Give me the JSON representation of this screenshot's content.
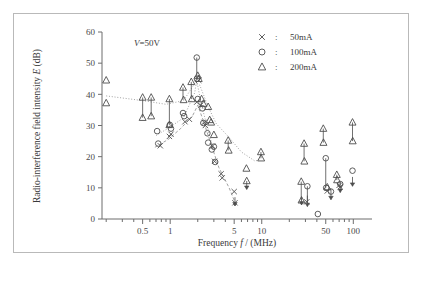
{
  "figure": {
    "annotation": "V=50V",
    "annotation_symbol": "V",
    "annotation_rest": "=50V"
  },
  "legend": {
    "position": "top-right",
    "separator": ":",
    "entries": [
      {
        "marker": "x-marker-icon",
        "symbol": "×",
        "label": "50mA"
      },
      {
        "marker": "circle-marker-icon",
        "symbol": "○",
        "label": "100mA"
      },
      {
        "marker": "triangle-marker-icon",
        "symbol": "△",
        "label": "200mA"
      }
    ]
  },
  "chart_data": {
    "type": "scatter",
    "title": "",
    "xlabel": "Frequency f / (MHz)",
    "xlabel_parts": {
      "pre": "Frequency ",
      "italic": "f",
      "post": " / (MHz)"
    },
    "ylabel": "Radio-interference field intensity E (dB)",
    "ylabel_parts": {
      "pre": "Radio-interference field intensity ",
      "italic": "E",
      "post": " (dB)"
    },
    "xscale": "log",
    "xlim": [
      0.18,
      160
    ],
    "ylim": [
      0,
      60
    ],
    "grid": false,
    "xticks": [
      0.5,
      1,
      5,
      10,
      50,
      100
    ],
    "xticklabels": [
      "0.5",
      "1",
      "5",
      "10",
      "50",
      "100"
    ],
    "xminorticks": [
      0.2,
      0.3,
      0.4,
      0.6,
      0.7,
      0.8,
      0.9,
      2,
      3,
      4,
      6,
      7,
      8,
      9,
      20,
      30,
      40,
      60,
      70,
      80,
      90
    ],
    "yticks": [
      0,
      10,
      20,
      30,
      40,
      50,
      60
    ],
    "yticklabels": [
      "0",
      "10",
      "20",
      "30",
      "40",
      "50",
      "60"
    ],
    "condition": "V=50V",
    "series": [
      {
        "name": "50mA",
        "marker": "x",
        "points": [
          {
            "x": 0.78,
            "y": 23.5
          },
          {
            "x": 0.98,
            "y": 26.5
          },
          {
            "x": 1.02,
            "y": 27.2
          },
          {
            "x": 1.45,
            "y": 31.2
          },
          {
            "x": 1.62,
            "y": 32.0
          },
          {
            "x": 1.95,
            "y": 37.5
          },
          {
            "x": 2.05,
            "y": 44.5
          },
          {
            "x": 2.15,
            "y": 36.5
          },
          {
            "x": 2.35,
            "y": 31.0
          },
          {
            "x": 2.42,
            "y": 30.0
          },
          {
            "x": 2.9,
            "y": 23.4
          },
          {
            "x": 3.05,
            "y": 18.5
          },
          {
            "x": 3.6,
            "y": 14.5
          },
          {
            "x": 3.7,
            "y": 13.2
          },
          {
            "x": 5.0,
            "y": 8.8
          },
          {
            "x": 5.1,
            "y": 5.2
          },
          {
            "x": 31.0,
            "y": 5.5
          },
          {
            "x": 52.0,
            "y": 9.0
          },
          {
            "x": 70.0,
            "y": 10.8
          },
          {
            "x": 72.0,
            "y": 10.3
          }
        ]
      },
      {
        "name": "100mA",
        "marker": "circle",
        "points": [
          {
            "x": 0.72,
            "y": 28.2
          },
          {
            "x": 0.74,
            "y": 24.2
          },
          {
            "x": 0.99,
            "y": 30.2
          },
          {
            "x": 1.02,
            "y": 29.0
          },
          {
            "x": 1.38,
            "y": 34.0
          },
          {
            "x": 1.42,
            "y": 33.0
          },
          {
            "x": 1.95,
            "y": 51.8
          },
          {
            "x": 1.96,
            "y": 45.0
          },
          {
            "x": 2.0,
            "y": 38.5
          },
          {
            "x": 2.25,
            "y": 35.5
          },
          {
            "x": 2.3,
            "y": 30.8
          },
          {
            "x": 2.55,
            "y": 27.5
          },
          {
            "x": 2.6,
            "y": 24.5
          },
          {
            "x": 2.85,
            "y": 22.3
          },
          {
            "x": 3.0,
            "y": 23.2
          },
          {
            "x": 3.1,
            "y": 18.3
          },
          {
            "x": 31.5,
            "y": 10.5
          },
          {
            "x": 41.0,
            "y": 1.6
          },
          {
            "x": 50.0,
            "y": 19.5
          },
          {
            "x": 50.5,
            "y": 10.0
          },
          {
            "x": 57.0,
            "y": 8.8
          },
          {
            "x": 72.0,
            "y": 11.2
          },
          {
            "x": 98.0,
            "y": 15.5
          }
        ]
      },
      {
        "name": "200mA",
        "marker": "triangle",
        "points": [
          {
            "x": 0.2,
            "y": 44.5
          },
          {
            "x": 0.2,
            "y": 37.2
          },
          {
            "x": 0.5,
            "y": 39.0
          },
          {
            "x": 0.5,
            "y": 32.5
          },
          {
            "x": 0.62,
            "y": 39.0
          },
          {
            "x": 0.62,
            "y": 33.0
          },
          {
            "x": 0.98,
            "y": 38.5
          },
          {
            "x": 0.98,
            "y": 30.2
          },
          {
            "x": 1.38,
            "y": 42.2
          },
          {
            "x": 1.4,
            "y": 38.2
          },
          {
            "x": 1.7,
            "y": 44.0
          },
          {
            "x": 1.72,
            "y": 38.5
          },
          {
            "x": 2.0,
            "y": 46.0
          },
          {
            "x": 2.05,
            "y": 45.0
          },
          {
            "x": 2.2,
            "y": 38.5
          },
          {
            "x": 2.3,
            "y": 37.0
          },
          {
            "x": 2.6,
            "y": 36.0
          },
          {
            "x": 2.7,
            "y": 31.8
          },
          {
            "x": 2.8,
            "y": 31.0
          },
          {
            "x": 3.0,
            "y": 27.0
          },
          {
            "x": 4.3,
            "y": 25.2
          },
          {
            "x": 4.35,
            "y": 22.0
          },
          {
            "x": 6.8,
            "y": 16.2
          },
          {
            "x": 6.85,
            "y": 12.2
          },
          {
            "x": 9.8,
            "y": 21.5
          },
          {
            "x": 9.85,
            "y": 19.5
          },
          {
            "x": 29.0,
            "y": 24.2
          },
          {
            "x": 29.2,
            "y": 18.5
          },
          {
            "x": 27.0,
            "y": 12.0
          },
          {
            "x": 27.2,
            "y": 6.0
          },
          {
            "x": 47.0,
            "y": 29.0
          },
          {
            "x": 47.2,
            "y": 24.5
          },
          {
            "x": 52.0,
            "y": 10.2
          },
          {
            "x": 66.0,
            "y": 14.2
          },
          {
            "x": 66.5,
            "y": 12.5
          },
          {
            "x": 98.0,
            "y": 31.0
          },
          {
            "x": 98.5,
            "y": 25.0
          }
        ]
      }
    ],
    "ranges": [
      {
        "x": 0.5,
        "ylow": 32.5,
        "yhigh": 39.0,
        "series": "200mA"
      },
      {
        "x": 0.62,
        "ylow": 33.0,
        "yhigh": 39.0,
        "series": "200mA"
      },
      {
        "x": 0.98,
        "ylow": 30.2,
        "yhigh": 38.5,
        "series": "200mA"
      },
      {
        "x": 1.38,
        "ylow": 38.2,
        "yhigh": 42.2,
        "series": "200mA"
      },
      {
        "x": 1.7,
        "ylow": 38.5,
        "yhigh": 44.0,
        "series": "200mA"
      },
      {
        "x": 4.3,
        "ylow": 22.0,
        "yhigh": 25.2,
        "series": "200mA"
      },
      {
        "x": 9.8,
        "ylow": 19.5,
        "yhigh": 21.5,
        "series": "200mA"
      },
      {
        "x": 29.0,
        "ylow": 18.5,
        "yhigh": 24.2,
        "series": "200mA"
      },
      {
        "x": 27.0,
        "ylow": 6.0,
        "yhigh": 12.0,
        "series": "200mA"
      },
      {
        "x": 47.0,
        "ylow": 24.5,
        "yhigh": 29.0,
        "series": "200mA"
      },
      {
        "x": 66.0,
        "ylow": 12.5,
        "yhigh": 14.2,
        "series": "200mA"
      },
      {
        "x": 98.0,
        "ylow": 25.0,
        "yhigh": 31.0,
        "series": "200mA"
      },
      {
        "x": 1.95,
        "ylow": 45.0,
        "yhigh": 51.8,
        "series": "100mA"
      },
      {
        "x": 31.5,
        "ylow": 5.5,
        "yhigh": 10.5,
        "series": "100mA"
      },
      {
        "x": 50.0,
        "ylow": 10.0,
        "yhigh": 19.5,
        "series": "100mA"
      }
    ],
    "arrows": [
      {
        "x": 6.85,
        "ytail": 12.2,
        "yhead": 9.5,
        "dir": "down"
      },
      {
        "x": 5.1,
        "ytail": 7.0,
        "yhead": 4.2,
        "dir": "down"
      },
      {
        "x": 27.2,
        "ytail": 7.0,
        "yhead": 4.5,
        "dir": "down"
      },
      {
        "x": 31.5,
        "ytail": 7.5,
        "yhead": 4.0,
        "dir": "down"
      },
      {
        "x": 57.0,
        "ytail": 9.5,
        "yhead": 6.2,
        "dir": "down"
      },
      {
        "x": 72.0,
        "ytail": 11.5,
        "yhead": 8.5,
        "dir": "down"
      },
      {
        "x": 98.0,
        "ytail": 13.5,
        "yhead": 10.5,
        "dir": "down"
      }
    ],
    "trendlines": [
      {
        "name": "200mA-trend",
        "style": "dotted",
        "points": [
          [
            0.2,
            39.5
          ],
          [
            0.5,
            38.0
          ],
          [
            0.9,
            36.8
          ],
          [
            1.4,
            38.0
          ],
          [
            1.85,
            43.5
          ],
          [
            2.1,
            43.0
          ],
          [
            2.6,
            36.0
          ],
          [
            3.2,
            30.5
          ],
          [
            4.3,
            26.5
          ],
          [
            6.0,
            21.5
          ],
          [
            8.5,
            18.5
          ],
          [
            9.8,
            19.5
          ]
        ]
      },
      {
        "name": "100mA-trend",
        "style": "dotted",
        "points": [
          [
            0.7,
            26.8
          ],
          [
            1.0,
            29.5
          ],
          [
            1.4,
            32.5
          ],
          [
            1.85,
            40.5
          ],
          [
            1.95,
            44.5
          ],
          [
            2.2,
            36.5
          ],
          [
            2.6,
            28.5
          ],
          [
            3.0,
            21.5
          ]
        ]
      },
      {
        "name": "50mA-trend",
        "style": "dashed",
        "points": [
          [
            0.68,
            23.0
          ],
          [
            0.95,
            25.5
          ],
          [
            1.3,
            29.0
          ],
          [
            1.75,
            33.0
          ],
          [
            2.0,
            36.5
          ],
          [
            2.3,
            31.5
          ],
          [
            2.8,
            24.0
          ],
          [
            3.4,
            16.5
          ],
          [
            4.4,
            10.0
          ],
          [
            5.2,
            4.8
          ]
        ]
      }
    ]
  }
}
